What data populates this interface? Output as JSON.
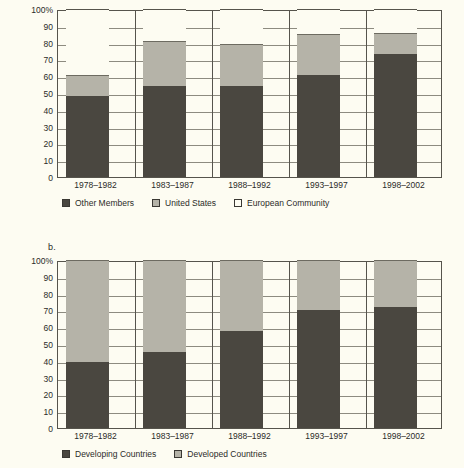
{
  "page": {
    "background": "#fdfcf2",
    "panel_b_letter": "b."
  },
  "colors": {
    "dark": "#4a4740",
    "gray": "#b5b3a8",
    "white": "#fdfcf2",
    "axis": "#56544c",
    "grid": "#8d8b80",
    "text": "#2b2b28"
  },
  "chart_data": [
    {
      "id": "chart-a",
      "type": "bar",
      "stacked": true,
      "title": "",
      "xlabel": "",
      "ylabel": "",
      "ylim": [
        0,
        100
      ],
      "ytick_labels": [
        "100%",
        "90",
        "80",
        "70",
        "60",
        "50",
        "40",
        "30",
        "20",
        "10",
        "0"
      ],
      "ytick_values": [
        100,
        90,
        80,
        70,
        60,
        50,
        40,
        30,
        20,
        10,
        0
      ],
      "grid": true,
      "legend_position": "bottom",
      "categories": [
        "1978–1982",
        "1983–1987",
        "1988–1992",
        "1993–1997",
        "1998–2002"
      ],
      "series": [
        {
          "name": "Other Members",
          "color": "#4a4740",
          "values": [
            48,
            54,
            54,
            61,
            73
          ]
        },
        {
          "name": "United States",
          "color": "#b5b3a8",
          "values": [
            13,
            27,
            25,
            24,
            13
          ]
        },
        {
          "name": "European Community",
          "color": "#fdfcf2",
          "values": [
            39,
            19,
            21,
            15,
            14
          ]
        }
      ]
    },
    {
      "id": "chart-b",
      "type": "bar",
      "stacked": true,
      "title": "",
      "xlabel": "",
      "ylabel": "",
      "ylim": [
        0,
        100
      ],
      "ytick_labels": [
        "100%",
        "90",
        "80",
        "70",
        "60",
        "50",
        "40",
        "30",
        "20",
        "10",
        "0"
      ],
      "ytick_values": [
        100,
        90,
        80,
        70,
        60,
        50,
        40,
        30,
        20,
        10,
        0
      ],
      "grid": true,
      "legend_position": "bottom",
      "categories": [
        "1978–1982",
        "1983–1987",
        "1988–1992",
        "1993–1997",
        "1998–2002"
      ],
      "series": [
        {
          "name": "Developing Countries",
          "color": "#4a4740",
          "values": [
            39,
            45,
            58,
            70,
            72
          ]
        },
        {
          "name": "Developed Countries",
          "color": "#b5b3a8",
          "values": [
            61,
            55,
            42,
            30,
            28
          ]
        }
      ]
    }
  ]
}
